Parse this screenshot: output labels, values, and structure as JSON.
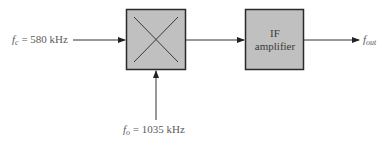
{
  "diagram": {
    "type": "block-diagram",
    "inputs": {
      "carrier": {
        "symbol": "f",
        "subscript": "c",
        "equals": "=",
        "value": "580 kHz"
      },
      "oscillator": {
        "symbol": "f",
        "subscript": "o",
        "equals": "=",
        "value": "1035 kHz"
      }
    },
    "blocks": {
      "mixer": {
        "label": "",
        "icon": "multiply-x-icon"
      },
      "if_amplifier": {
        "line1": "IF",
        "line2": "amplifier"
      }
    },
    "output": {
      "symbol": "f",
      "subscript": "out"
    },
    "colors": {
      "block_fill": "#c0c0c0",
      "block_border": "#2a2a2a",
      "line": "#333333",
      "text": "#5a5a5a"
    }
  }
}
